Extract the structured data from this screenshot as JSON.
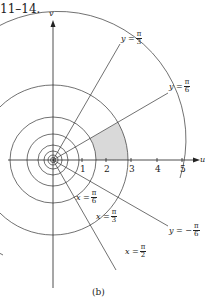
{
  "header": {
    "text": "11–14."
  },
  "caption": "(b)",
  "axes": {
    "horizontal_label": "u",
    "vertical_label": "v",
    "ticks": [
      "1",
      "2",
      "3",
      "4",
      "5"
    ]
  },
  "curve_labels": {
    "y_pi_3": {
      "var": "y =",
      "num": "π",
      "den": "3"
    },
    "y_pi_6": {
      "var": "y =",
      "num": "π",
      "den": "6"
    },
    "y_neg_pi_6": {
      "var": "y = −",
      "num": "π",
      "den": "6"
    },
    "x_pi_6": {
      "var": "x =",
      "num": "π",
      "den": "6"
    },
    "x_pi_3": {
      "var": "x =",
      "num": "π",
      "den": "3"
    },
    "x_pi_2": {
      "var": "x =",
      "num": "π",
      "den": "2"
    }
  },
  "colors": {
    "line": "#333333",
    "shade": "#d9d9d9"
  }
}
